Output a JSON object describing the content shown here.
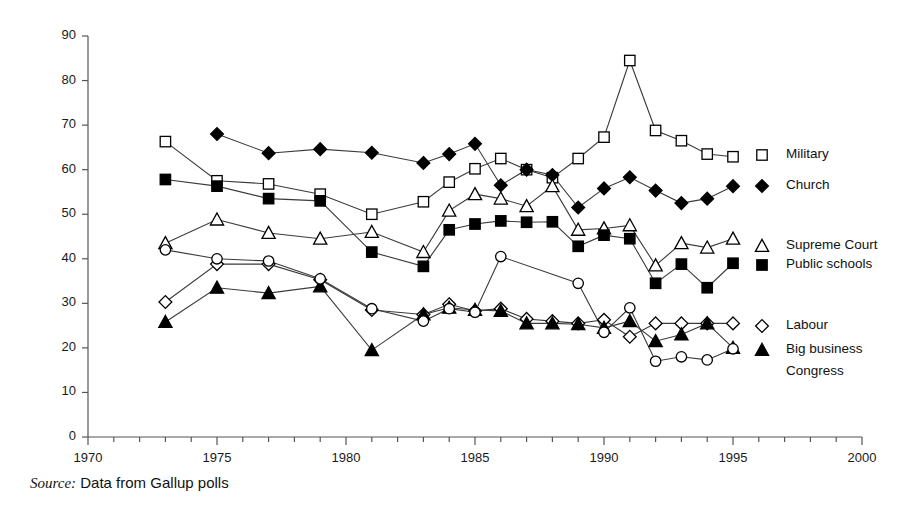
{
  "source_note": {
    "label": "Source:",
    "text": "Data from Gallup polls"
  },
  "chart_data": {
    "type": "line",
    "title": "",
    "subtitle": "",
    "xlabel": "",
    "ylabel": "",
    "xlim": [
      1970,
      2000
    ],
    "ylim": [
      0,
      90
    ],
    "ytick_step": 10,
    "yticks": [
      0,
      10,
      20,
      30,
      40,
      50,
      60,
      70,
      80,
      90
    ],
    "ytick_labels": [
      "0",
      "10",
      "20",
      "30",
      "40",
      "50",
      "60",
      "70",
      "80",
      "90"
    ],
    "xticks_major": [
      1970,
      1975,
      1980,
      1985,
      1990,
      1995,
      2000
    ],
    "xtick_labels": [
      "1970",
      "1975",
      "1980",
      "1985",
      "1990",
      "1995",
      "2000"
    ],
    "xtick_minor_step": 1,
    "grid": false,
    "legend_position": "right-inline",
    "line_color": "#3a3a3a",
    "marker_color": "#000000",
    "axis_color": "#555555",
    "series": [
      {
        "name": "Military",
        "marker": "open-square",
        "filled": false,
        "x": [
          1973,
          1975,
          1977,
          1979,
          1981,
          1983,
          1984,
          1985,
          1986,
          1987,
          1988,
          1989,
          1990,
          1991,
          1992,
          1993,
          1994,
          1995
        ],
        "values": [
          66.3,
          57.5,
          56.8,
          54.5,
          50.0,
          52.8,
          57.2,
          60.2,
          62.5,
          60.0,
          58.2,
          62.5,
          67.3,
          84.5,
          68.8,
          66.5,
          63.5,
          62.9
        ]
      },
      {
        "name": "Church",
        "marker": "filled-diamond",
        "filled": true,
        "x": [
          1975,
          1977,
          1979,
          1981,
          1983,
          1984,
          1985,
          1986,
          1987,
          1988,
          1989,
          1990,
          1991,
          1992,
          1993,
          1994,
          1995
        ],
        "values": [
          68.0,
          63.7,
          64.6,
          63.8,
          61.5,
          63.5,
          65.8,
          56.5,
          60.0,
          58.8,
          51.5,
          55.8,
          58.3,
          55.3,
          52.5,
          53.5,
          56.3
        ]
      },
      {
        "name": "Supreme Court",
        "marker": "open-triangle",
        "filled": false,
        "x": [
          1973,
          1975,
          1977,
          1979,
          1981,
          1983,
          1984,
          1985,
          1986,
          1987,
          1988,
          1989,
          1990,
          1991,
          1992,
          1993,
          1994,
          1995
        ],
        "values": [
          43.5,
          48.8,
          45.8,
          44.5,
          46.0,
          41.5,
          50.8,
          54.5,
          53.5,
          51.8,
          56.3,
          46.5,
          46.8,
          47.5,
          38.5,
          43.5,
          42.5,
          44.5
        ]
      },
      {
        "name": "Public schools",
        "marker": "filled-square",
        "filled": true,
        "x": [
          1973,
          1975,
          1977,
          1979,
          1981,
          1983,
          1984,
          1985,
          1986,
          1987,
          1988,
          1989,
          1990,
          1991,
          1992,
          1993,
          1994,
          1995
        ],
        "values": [
          57.8,
          56.3,
          53.5,
          53.0,
          41.5,
          38.3,
          46.5,
          47.8,
          48.5,
          48.2,
          48.3,
          42.8,
          45.3,
          44.5,
          34.5,
          38.8,
          33.5,
          39.0
        ]
      },
      {
        "name": "Labour",
        "marker": "open-diamond",
        "filled": false,
        "x": [
          1973,
          1975,
          1977,
          1979,
          1981,
          1983,
          1984,
          1985,
          1986,
          1987,
          1988,
          1989,
          1990,
          1991,
          1992,
          1993,
          1994,
          1995
        ],
        "values": [
          30.3,
          38.8,
          38.8,
          35.3,
          28.5,
          27.5,
          29.8,
          28.3,
          28.8,
          26.5,
          26.0,
          25.5,
          26.3,
          22.5,
          25.5,
          25.5,
          25.5,
          25.5
        ]
      },
      {
        "name": "Big business",
        "marker": "filled-triangle",
        "filled": true,
        "x": [
          1973,
          1975,
          1977,
          1979,
          1981,
          1983,
          1984,
          1985,
          1986,
          1987,
          1988,
          1989,
          1990,
          1991,
          1992,
          1993,
          1994,
          1995
        ],
        "values": [
          25.8,
          33.5,
          32.3,
          33.8,
          19.5,
          27.5,
          29.0,
          28.5,
          28.3,
          25.5,
          25.5,
          25.3,
          24.5,
          26.0,
          21.5,
          23.0,
          25.5,
          20.0
        ]
      },
      {
        "name": "Congress",
        "marker": "open-circle",
        "filled": false,
        "x": [
          1973,
          1975,
          1977,
          1979,
          1981,
          1983,
          1984,
          1985,
          1986,
          1989,
          1990,
          1991,
          1992,
          1993,
          1994,
          1995
        ],
        "values": [
          42.0,
          40.0,
          39.5,
          35.5,
          28.8,
          26.0,
          28.8,
          28.0,
          40.5,
          34.5,
          23.5,
          29.0,
          17.0,
          18.0,
          17.3,
          19.8
        ]
      }
    ],
    "legend": [
      {
        "name": "Military",
        "marker": "open-square",
        "label_y": 155
      },
      {
        "name": "Church",
        "marker": "filled-diamond",
        "label_y": 186
      },
      {
        "name": "Supreme Court",
        "marker": "open-triangle",
        "label_y": 246
      },
      {
        "name": "Public schools",
        "marker": "filled-square",
        "label_y": 265
      },
      {
        "name": "Labour",
        "marker": "open-diamond",
        "label_y": 326
      },
      {
        "name": "Big business",
        "marker": "filled-triangle",
        "label_y": 350
      },
      {
        "name": "Congress",
        "marker": "none",
        "label_y": 372
      }
    ]
  }
}
